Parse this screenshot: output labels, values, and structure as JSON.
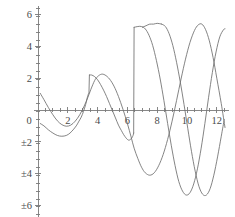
{
  "chart_data": {
    "type": "line",
    "title": "",
    "subtitle": "",
    "xlabel": "",
    "ylabel": "",
    "grid": false,
    "legend": "none",
    "xlim": [
      0,
      12.6
    ],
    "ylim": [
      -6.6,
      6.4
    ],
    "xticks": [
      0,
      2,
      4,
      6,
      8,
      10,
      12
    ],
    "xtick_labels": [
      "0",
      "2",
      "4",
      "6",
      "8",
      "10",
      "12"
    ],
    "yticks": [
      6,
      4,
      2,
      0,
      -2,
      -4,
      -6
    ],
    "ytick_labels": [
      "6",
      "4",
      "2",
      "0",
      "±2",
      "±4",
      "±6"
    ],
    "xtick_minor_step": 0.5,
    "ytick_minor_step": 0.5,
    "axis_color": "#7a7a7a",
    "curve_color": "#6e6e6e",
    "background_color": "#ffffff",
    "series": [
      {
        "name": "smooth-oscillation",
        "style": "continuous",
        "points": [
          [
            0.15,
            1.05
          ],
          [
            0.4,
            0.65
          ],
          [
            0.7,
            0.15
          ],
          [
            1.0,
            -0.3
          ],
          [
            1.3,
            -0.68
          ],
          [
            1.6,
            -0.92
          ],
          [
            1.9,
            -1.02
          ],
          [
            2.2,
            -0.95
          ],
          [
            2.5,
            -0.7
          ],
          [
            2.8,
            -0.3
          ],
          [
            3.1,
            0.25
          ],
          [
            3.35,
            0.8
          ],
          [
            3.55,
            1.3
          ],
          [
            3.8,
            1.85
          ],
          [
            4.0,
            2.1
          ],
          [
            4.25,
            2.25
          ],
          [
            4.5,
            2.2
          ],
          [
            4.8,
            1.95
          ],
          [
            5.1,
            1.5
          ],
          [
            5.4,
            0.85
          ],
          [
            5.7,
            0.05
          ],
          [
            6.0,
            -0.85
          ],
          [
            6.25,
            -1.7
          ],
          [
            6.45,
            -2.4
          ],
          [
            6.7,
            -3.05
          ],
          [
            6.95,
            -3.6
          ],
          [
            7.2,
            -3.95
          ],
          [
            7.5,
            -4.1
          ],
          [
            7.8,
            -3.95
          ],
          [
            8.1,
            -3.5
          ],
          [
            8.4,
            -2.8
          ],
          [
            8.7,
            -1.85
          ],
          [
            9.0,
            -0.7
          ],
          [
            9.3,
            0.6
          ],
          [
            9.6,
            1.95
          ],
          [
            9.9,
            3.2
          ],
          [
            10.2,
            4.25
          ],
          [
            10.5,
            5.0
          ],
          [
            10.75,
            5.35
          ],
          [
            11.0,
            5.4
          ],
          [
            11.25,
            5.05
          ],
          [
            11.5,
            4.35
          ],
          [
            11.75,
            3.3
          ],
          [
            12.0,
            2.0
          ],
          [
            12.3,
            0.4
          ],
          [
            12.55,
            -1.1
          ]
        ]
      },
      {
        "name": "jump-oscillation",
        "style": "discontinuous",
        "segments": [
          {
            "points": [
              [
                0.15,
                -0.85
              ],
              [
                0.4,
                -1.0
              ],
              [
                0.7,
                -1.25
              ],
              [
                1.0,
                -1.45
              ],
              [
                1.3,
                -1.6
              ],
              [
                1.6,
                -1.65
              ],
              [
                1.9,
                -1.6
              ],
              [
                2.15,
                -1.45
              ],
              [
                2.4,
                -1.2
              ],
              [
                2.6,
                -0.95
              ],
              [
                2.75,
                -0.7
              ],
              [
                2.9,
                -0.45
              ],
              [
                3.05,
                -0.1
              ],
              [
                3.2,
                0.35
              ],
              [
                3.3,
                0.75
              ],
              [
                3.38,
                1.0
              ],
              [
                3.42,
                1.05
              ]
            ]
          },
          {
            "points": [
              [
                3.45,
                2.2
              ],
              [
                3.6,
                2.2
              ],
              [
                3.8,
                2.1
              ],
              [
                4.0,
                1.9
              ],
              [
                4.2,
                1.6
              ],
              [
                4.4,
                1.25
              ],
              [
                4.6,
                0.85
              ],
              [
                4.8,
                0.4
              ],
              [
                5.0,
                -0.05
              ],
              [
                5.2,
                -0.5
              ],
              [
                5.4,
                -0.95
              ],
              [
                5.6,
                -1.3
              ],
              [
                5.75,
                -1.55
              ],
              [
                5.9,
                -1.75
              ],
              [
                6.0,
                -1.85
              ],
              [
                6.1,
                -1.9
              ],
              [
                6.2,
                -1.85
              ],
              [
                6.3,
                -1.75
              ],
              [
                6.38,
                -1.6
              ],
              [
                6.42,
                -1.45
              ]
            ]
          },
          {
            "points": [
              [
                6.45,
                5.2
              ],
              [
                6.7,
                5.25
              ],
              [
                6.95,
                5.25
              ],
              [
                7.2,
                5.1
              ],
              [
                7.45,
                4.7
              ],
              [
                7.7,
                4.05
              ],
              [
                7.95,
                3.1
              ],
              [
                8.2,
                1.95
              ],
              [
                8.45,
                0.6
              ],
              [
                8.7,
                -0.85
              ],
              [
                8.95,
                -2.25
              ],
              [
                9.2,
                -3.5
              ],
              [
                9.45,
                -4.5
              ],
              [
                9.7,
                -5.1
              ],
              [
                9.95,
                -5.35
              ],
              [
                10.2,
                -5.2
              ],
              [
                10.45,
                -4.65
              ],
              [
                10.7,
                -3.7
              ],
              [
                10.95,
                -2.4
              ],
              [
                11.2,
                -0.85
              ],
              [
                11.45,
                0.8
              ],
              [
                11.7,
                2.35
              ],
              [
                11.95,
                3.65
              ],
              [
                12.2,
                4.6
              ],
              [
                12.45,
                5.05
              ],
              [
                12.55,
                5.1
              ]
            ]
          }
        ]
      },
      {
        "name": "jump-oscillation-tail",
        "style": "continuous",
        "points": [
          [
            8.3,
            5.4
          ],
          [
            8.55,
            5.25
          ],
          [
            8.8,
            4.8
          ],
          [
            9.05,
            4.05
          ],
          [
            9.3,
            3.0
          ],
          [
            9.55,
            1.75
          ],
          [
            9.8,
            0.35
          ],
          [
            10.05,
            -1.15
          ],
          [
            10.3,
            -2.6
          ],
          [
            10.55,
            -3.85
          ],
          [
            10.8,
            -4.8
          ],
          [
            11.05,
            -5.3
          ],
          [
            11.3,
            -5.35
          ],
          [
            11.55,
            -4.95
          ],
          [
            11.8,
            -4.1
          ],
          [
            12.05,
            -2.95
          ],
          [
            12.3,
            -1.65
          ],
          [
            12.5,
            -0.6
          ]
        ]
      },
      {
        "name": "jump-oscillation-head",
        "style": "continuous",
        "points": [
          [
            7.0,
            5.2
          ],
          [
            7.25,
            5.3
          ],
          [
            7.5,
            5.4
          ],
          [
            7.75,
            5.4
          ],
          [
            8.0,
            5.45
          ],
          [
            8.3,
            5.4
          ]
        ]
      }
    ]
  }
}
